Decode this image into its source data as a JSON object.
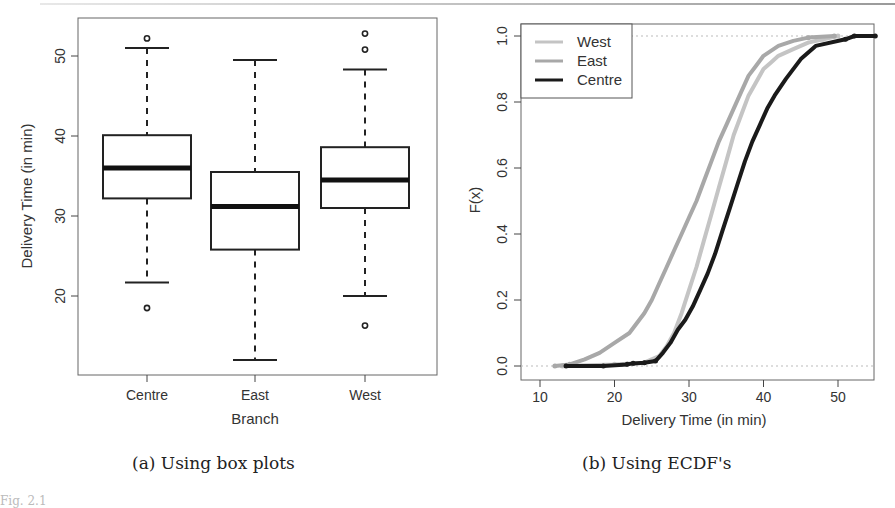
{
  "figure": {
    "fig_label": "Fig. 2.1",
    "panel_a_caption": "(a) Using box plots",
    "panel_b_caption": "(b) Using ECDF's"
  },
  "chart_data": [
    {
      "type": "box",
      "title": "",
      "xlabel": "Branch",
      "ylabel": "Delivery Time (in min)",
      "categories": [
        "Centre",
        "East",
        "West"
      ],
      "yticks": [
        20,
        30,
        40,
        50
      ],
      "ylim": [
        10,
        55
      ],
      "grid": false,
      "series": [
        {
          "name": "Centre",
          "whisker_low": 21.7,
          "q1": 32.2,
          "median": 36.0,
          "q3": 40.1,
          "whisker_high": 51.0,
          "outliers": [
            18.5,
            52.2
          ]
        },
        {
          "name": "East",
          "whisker_low": 12.0,
          "q1": 25.8,
          "median": 31.2,
          "q3": 35.5,
          "whisker_high": 49.5,
          "outliers": []
        },
        {
          "name": "West",
          "whisker_low": 20.0,
          "q1": 31.0,
          "median": 34.5,
          "q3": 38.6,
          "whisker_high": 48.3,
          "outliers": [
            16.3,
            50.8,
            52.8
          ]
        }
      ]
    },
    {
      "type": "line",
      "subtype": "ecdf",
      "title": "",
      "xlabel": "Delivery Time (in min)",
      "ylabel": "F(x)",
      "xticks": [
        10,
        20,
        30,
        40,
        50
      ],
      "yticks": [
        "0.0",
        "0.2",
        "0.4",
        "0.6",
        "0.8",
        "1.0"
      ],
      "xlim": [
        7.5,
        55
      ],
      "ylim": [
        -0.04,
        1.04
      ],
      "grid": false,
      "reference_lines": [
        0,
        1
      ],
      "legend": {
        "position": "top-left",
        "entries": [
          "West",
          "East",
          "Centre"
        ]
      },
      "series": [
        {
          "name": "West",
          "color": "#c4c4c4",
          "x": [
            13,
            20,
            24,
            26,
            27,
            28,
            29,
            30,
            31,
            32,
            33,
            34,
            35,
            36,
            37,
            38,
            39,
            40,
            41,
            42,
            44,
            46,
            48,
            50
          ],
          "y": [
            0.0,
            0.005,
            0.01,
            0.03,
            0.06,
            0.1,
            0.16,
            0.23,
            0.3,
            0.38,
            0.46,
            0.54,
            0.62,
            0.7,
            0.76,
            0.82,
            0.86,
            0.9,
            0.92,
            0.94,
            0.96,
            0.98,
            0.99,
            1.0
          ]
        },
        {
          "name": "East",
          "color": "#a8a8a8",
          "x": [
            12,
            14,
            16,
            18,
            20,
            22,
            24,
            25,
            26,
            27,
            28,
            29,
            30,
            31,
            32,
            33,
            34,
            35,
            36,
            37,
            38,
            39,
            40,
            42,
            44,
            46,
            49.5
          ],
          "y": [
            0.0,
            0.005,
            0.02,
            0.04,
            0.07,
            0.1,
            0.16,
            0.2,
            0.25,
            0.3,
            0.35,
            0.4,
            0.45,
            0.5,
            0.56,
            0.62,
            0.68,
            0.73,
            0.78,
            0.83,
            0.88,
            0.91,
            0.94,
            0.97,
            0.985,
            0.995,
            1.0
          ]
        },
        {
          "name": "Centre",
          "color": "#1a1a1a",
          "x": [
            13.5,
            18.5,
            21.7,
            22.5,
            24,
            25.5,
            26.5,
            27.5,
            28.5,
            29.5,
            30.5,
            31.5,
            32.5,
            33.5,
            34.5,
            35.5,
            36.5,
            37.5,
            38.5,
            39.5,
            40.5,
            41.5,
            43,
            45,
            47,
            51,
            52.2,
            55
          ],
          "y": [
            0.0,
            0.0,
            0.005,
            0.008,
            0.01,
            0.015,
            0.04,
            0.07,
            0.11,
            0.14,
            0.18,
            0.23,
            0.28,
            0.34,
            0.41,
            0.48,
            0.55,
            0.62,
            0.68,
            0.73,
            0.78,
            0.82,
            0.87,
            0.93,
            0.97,
            0.99,
            1.0,
            1.0
          ]
        }
      ]
    }
  ]
}
